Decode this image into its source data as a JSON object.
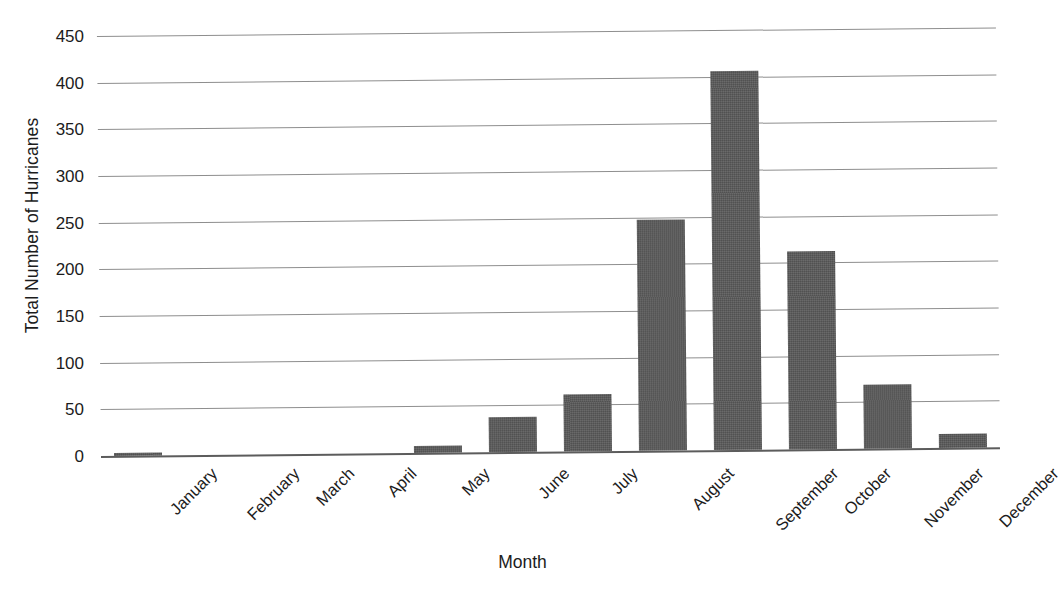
{
  "chart_data": {
    "type": "bar",
    "title": "",
    "xlabel": "Month",
    "ylabel": "Total Number of Hurricanes",
    "categories": [
      "January",
      "February",
      "March",
      "April",
      "May",
      "June",
      "July",
      "August",
      "September",
      "October",
      "November",
      "December"
    ],
    "values": [
      3,
      0,
      0,
      0,
      8,
      38,
      61,
      248,
      406,
      212,
      69,
      15
    ],
    "ylim": [
      0,
      450
    ],
    "yticks": [
      0,
      50,
      100,
      150,
      200,
      250,
      300,
      350,
      400,
      450
    ],
    "ytick_labels": [
      "0",
      "50",
      "100",
      "150",
      "200",
      "250",
      "300",
      "350",
      "400",
      "450"
    ],
    "grid": true,
    "grid_axis": "y",
    "legend": false,
    "bar_color": "#595959",
    "gridline_color": "#8e8e8e",
    "axis_color": "#5c5c5c",
    "background_color": "#ffffff",
    "xtick_rotation": -45
  }
}
